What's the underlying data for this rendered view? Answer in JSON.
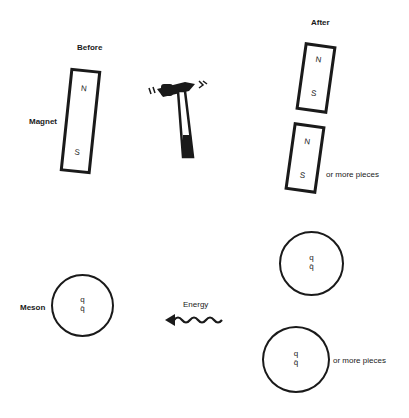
{
  "labels": {
    "before": "Before",
    "after": "After",
    "magnet": "Magnet",
    "meson": "Meson",
    "energy": "Energy",
    "or_more_pieces_top": "or more pieces",
    "or_more_pieces_bottom": "or more pieces"
  },
  "magnets": {
    "before": {
      "north": "N",
      "south": "S"
    },
    "after_1": {
      "north": "N",
      "south": "S"
    },
    "after_2": {
      "north": "N",
      "south": "S"
    }
  },
  "mesons": {
    "before": {
      "quark": "q",
      "antiquark": "q̄"
    },
    "after_1": {
      "quark": "q",
      "antiquark": "q̄"
    },
    "after_2": {
      "quark": "q",
      "antiquark": "q̄"
    }
  },
  "icons": {
    "hammer": "hammer-icon",
    "energy_arrow": "wavy-arrow-icon"
  }
}
